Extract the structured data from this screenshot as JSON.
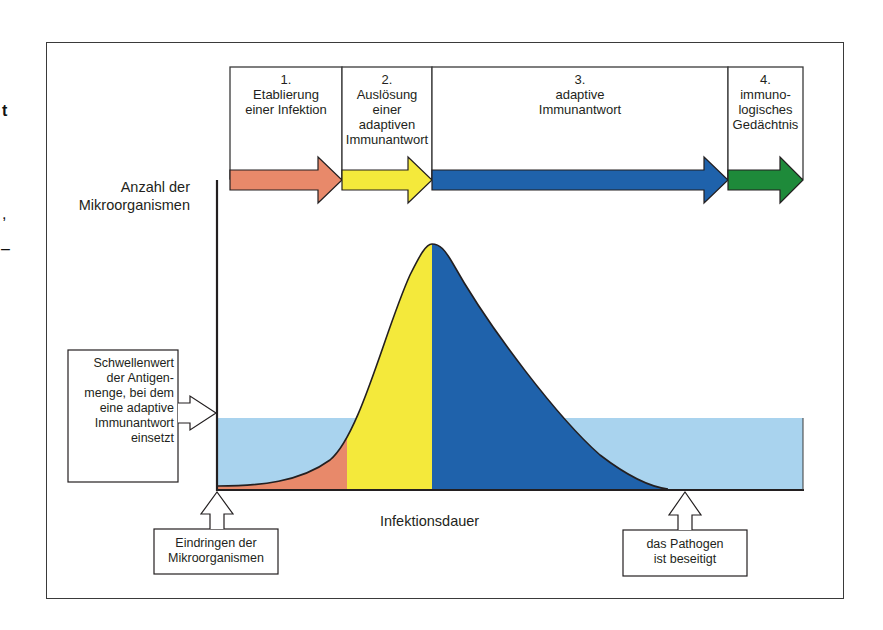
{
  "diagram": {
    "y_axis_label_line1": "Anzahl der",
    "y_axis_label_line2": "Mikroorganismen",
    "x_axis_label": "Infektionsdauer",
    "phases": [
      {
        "number": "1.",
        "lines": [
          "Etablierung",
          "einer Infektion"
        ],
        "color": "#e8896a"
      },
      {
        "number": "2.",
        "lines": [
          "Auslösung",
          "einer",
          "adaptiven",
          "Immunantwort"
        ],
        "color": "#f4e93b"
      },
      {
        "number": "3.",
        "lines": [
          "adaptive",
          "Immunantwort"
        ],
        "color": "#1f62ab"
      },
      {
        "number": "4.",
        "lines": [
          "immuno-",
          "logisches",
          "Gedächtnis"
        ],
        "color": "#1e8a3a"
      }
    ],
    "callouts": {
      "threshold": [
        "Schwellenwert",
        "der Antigen-",
        "menge, bei dem",
        "eine adaptive",
        "Immunantwort",
        "einsetzt"
      ],
      "invasion": [
        "Eindringen der",
        "Mikroorganismen"
      ],
      "cleared": [
        "das Pathogen",
        "ist beseitigt"
      ]
    },
    "colors": {
      "threshold_band": "#a9d3ee",
      "phase1_fill": "#e8896a",
      "phase2_fill": "#f4e93b",
      "phase3_fill": "#1f62ab",
      "phase4_fill": "#1e8a3a",
      "outline": "#231f20"
    },
    "margin_glyphs": [
      "t",
      ",",
      "–"
    ]
  }
}
